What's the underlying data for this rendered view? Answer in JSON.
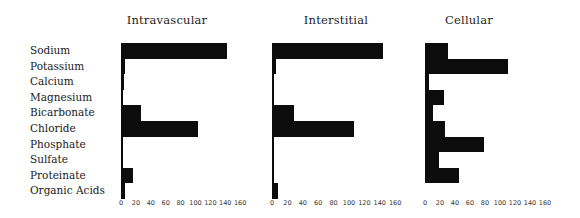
{
  "chart_data": [
    {
      "type": "bar",
      "orientation": "horizontal",
      "title": "Intravascular",
      "categories": [
        "Sodium",
        "Potassium",
        "Calcium",
        "Magnesium",
        "Bicarbonate",
        "Chloride",
        "Phosphate",
        "Sulfate",
        "Proteinate",
        "Organic Acids"
      ],
      "values": [
        142,
        5,
        4,
        2,
        27,
        104,
        2,
        1,
        16,
        6
      ],
      "xticks": [
        0,
        20,
        40,
        60,
        80,
        100,
        120,
        140,
        160
      ],
      "xlim": [
        0,
        160
      ],
      "xlabel": "",
      "ylabel": "",
      "grid": false,
      "legend": null
    },
    {
      "type": "bar",
      "orientation": "horizontal",
      "title": "Interstitial",
      "categories": [
        "Sodium",
        "Potassium",
        "Calcium",
        "Magnesium",
        "Bicarbonate",
        "Chloride",
        "Phosphate",
        "Sulfate",
        "Proteinate",
        "Organic Acids"
      ],
      "values": [
        144,
        5,
        3,
        2,
        29,
        107,
        2,
        1,
        1,
        8
      ],
      "xticks": [
        0,
        20,
        40,
        60,
        80,
        100,
        120,
        140,
        160
      ],
      "xlim": [
        0,
        160
      ],
      "xlabel": "",
      "ylabel": "",
      "grid": false,
      "legend": null
    },
    {
      "type": "bar",
      "orientation": "horizontal",
      "title": "Cellular",
      "categories": [
        "Sodium",
        "Potassium",
        "Calcium",
        "Magnesium",
        "Bicarbonate",
        "Chloride",
        "Phosphate",
        "Sulfate",
        "Proteinate",
        "Organic Acids"
      ],
      "values": [
        30,
        110,
        5,
        25,
        10,
        27,
        78,
        18,
        45,
        0
      ],
      "xticks": [
        0,
        20,
        40,
        60,
        80,
        100,
        120,
        140,
        160
      ],
      "xlim": [
        0,
        160
      ],
      "xlabel": "",
      "ylabel": "",
      "grid": false,
      "legend": null
    }
  ],
  "labels": [
    "Sodium",
    "Potassium",
    "Calcium",
    "Magnesium",
    "Bicarbonate",
    "Chloride",
    "Phosphate",
    "Sulfate",
    "Proteinate",
    "Organic Acids"
  ],
  "panels": [
    {
      "title": "Intravascular"
    },
    {
      "title": "Interstitial"
    },
    {
      "title": "Cellular"
    }
  ],
  "colors": {
    "bar": "#0c0c0c",
    "background": "#ffffff"
  }
}
